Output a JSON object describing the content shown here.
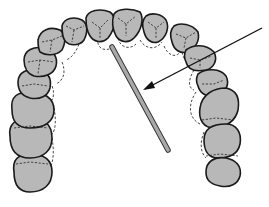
{
  "diagram": {
    "type": "dental arch illustration",
    "colors": {
      "tooth_fill": "#b8b8b8",
      "outline": "#1a1a1a",
      "rod": "#a9a9a9",
      "background": "#ffffff"
    },
    "elements": {
      "teeth_count": 14,
      "dashed_outlines": "alternate tooth positions",
      "rod": {
        "from": [
          112,
          47
        ],
        "to": [
          168,
          150
        ]
      },
      "arrow": {
        "from": [
          262,
          28
        ],
        "to": [
          143,
          90
        ]
      }
    },
    "labels": []
  }
}
